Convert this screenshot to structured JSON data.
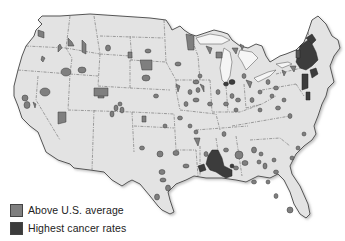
{
  "map": {
    "title": "",
    "region": "Contiguous United States",
    "land_color": "#e3e3e3",
    "border_color": "#555555",
    "state_line_color": "#666666"
  },
  "legend": {
    "items": [
      {
        "label": "Above U.S. average",
        "color": "#7f7f7f"
      },
      {
        "label": "Highest cancer rates",
        "color": "#3c3c3c"
      }
    ]
  }
}
